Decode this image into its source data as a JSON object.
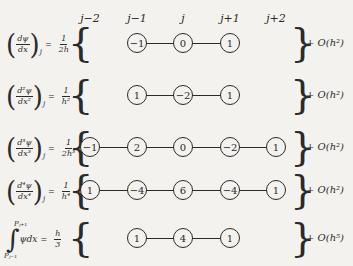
{
  "columns": [
    {
      "label": "j−2",
      "x": 90
    },
    {
      "label": "j−1",
      "x": 137
    },
    {
      "label": "j",
      "x": 183
    },
    {
      "label": "j+1",
      "x": 230
    },
    {
      "label": "j+2",
      "x": 276
    }
  ],
  "rows": [
    {
      "lhs_num": "dψ",
      "lhs_den": "dx",
      "sub": "j",
      "coef_num": "1",
      "coef_den": "2h",
      "nodes": [
        "",
        "−1",
        "0",
        "1",
        ""
      ],
      "order": "O(h²)"
    },
    {
      "lhs_num": "d²ψ",
      "lhs_den": "dx²",
      "sub": "j",
      "coef_num": "1",
      "coef_den": "h²",
      "nodes": [
        "",
        "1",
        "−2",
        "1",
        ""
      ],
      "order": "O(h²)"
    },
    {
      "lhs_num": "d³ψ",
      "lhs_den": "dx³",
      "sub": "j",
      "coef_num": "1",
      "coef_den": "2h³",
      "nodes": [
        "−1",
        "2",
        "0",
        "−2",
        "1"
      ],
      "order": "O(h²)"
    },
    {
      "lhs_num": "d⁴ψ",
      "lhs_den": "dx⁴",
      "sub": "j",
      "coef_num": "1",
      "coef_den": "h⁴",
      "nodes": [
        "1",
        "−4",
        "6",
        "−4",
        "1"
      ],
      "order": "O(h²)"
    },
    {
      "integral_upper": "Pⱼ₊₁",
      "integral_lower": "Pⱼ₋₁",
      "integrand": "ψdx",
      "coef_num": "h",
      "coef_den": "3",
      "nodes": [
        "",
        "1",
        "4",
        "1",
        ""
      ],
      "order": "O(h⁵)"
    }
  ]
}
